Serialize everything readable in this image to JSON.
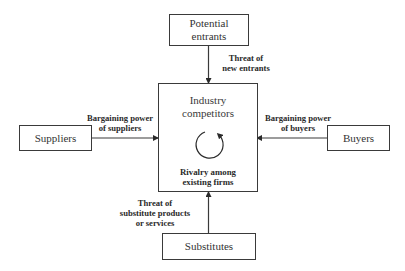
{
  "diagram": {
    "type": "five-forces",
    "colors": {
      "stroke": "#3a3a3a",
      "text": "#2a2a2a",
      "background": "#ffffff"
    },
    "nodes": {
      "potential_entrants": {
        "label": "Potential\nentrants"
      },
      "industry_competitors": {
        "label": "Industry\ncompetitors",
        "sublabel": "Rivalry among\nexisting firms",
        "icon": "cycle-arrow-icon"
      },
      "suppliers": {
        "label": "Suppliers"
      },
      "buyers": {
        "label": "Buyers"
      },
      "substitutes": {
        "label": "Substitutes"
      }
    },
    "edges": [
      {
        "from": "potential_entrants",
        "to": "industry_competitors",
        "label": "Threat of\nnew entrants"
      },
      {
        "from": "suppliers",
        "to": "industry_competitors",
        "label": "Bargaining power\nof suppliers"
      },
      {
        "from": "buyers",
        "to": "industry_competitors",
        "label": "Bargaining power\nof buyers"
      },
      {
        "from": "substitutes",
        "to": "industry_competitors",
        "label": "Threat of\nsubstitute products\nor services"
      }
    ]
  }
}
